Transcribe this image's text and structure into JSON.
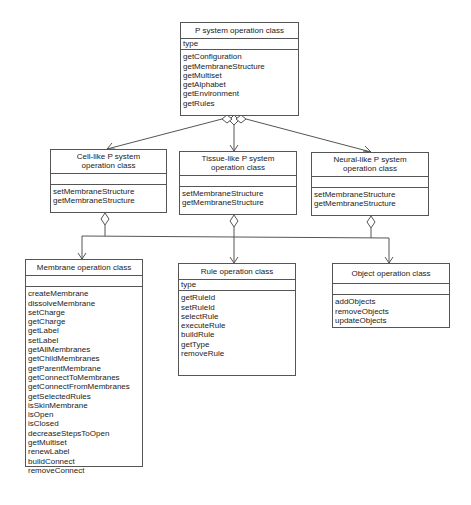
{
  "classes": {
    "psystem": {
      "title": "P system operation class",
      "attributes": [
        "type"
      ],
      "operations": [
        "getConfiguration",
        "getMembraneStructure",
        "getMultiset",
        "getAlphabet",
        "getEnvironment",
        "getRules"
      ]
    },
    "cell": {
      "title": "Cell-like P system operation class",
      "attributes": [],
      "operations": [
        "setMembraneStructure",
        "getMembraneStructure"
      ]
    },
    "tissue": {
      "title": "Tissue-like P system operation class",
      "attributes": [],
      "operations": [
        "setMembraneStructure",
        "getMembraneStructure"
      ]
    },
    "neural": {
      "title": "Neural-like P system operation class",
      "attributes": [],
      "operations": [
        "setMembraneStructure",
        "getMembraneStructure"
      ]
    },
    "membrane": {
      "title": "Membrane operation class",
      "attributes": [],
      "operations": [
        "createMembrane",
        "dissolveMembrane",
        "setCharge",
        "getCharge",
        "getLabel",
        "setLabel",
        "getAllMembranes",
        "getChildMembranes",
        "getParentMembrane",
        "getConnectToMembranes",
        "getConnectFromMembranes",
        "getSelectedRules",
        "isSkinMembrane",
        "isOpen",
        "isClosed",
        "decreaseStepsToOpen",
        "getMultiset",
        "renewLabel",
        "buildConnect",
        "removeConnect"
      ]
    },
    "rule": {
      "title": "Rule operation class",
      "attributes": [
        "type"
      ],
      "operations": [
        "getRuleId",
        "setRuleId",
        "selectRule",
        "executeRule",
        "buildRule",
        "getType",
        "removeRule"
      ]
    },
    "object": {
      "title": "Object operation class",
      "attributes": [],
      "operations": [
        "addObjects",
        "removeObjects",
        "updateObjects"
      ]
    }
  },
  "relations": [
    {
      "type": "aggregation",
      "from": "psystem",
      "to": "cell"
    },
    {
      "type": "aggregation",
      "from": "psystem",
      "to": "tissue"
    },
    {
      "type": "aggregation",
      "from": "psystem",
      "to": "neural"
    },
    {
      "type": "aggregation",
      "from": "cell",
      "to": "membrane"
    },
    {
      "type": "aggregation",
      "from": "tissue",
      "to": "rule"
    },
    {
      "type": "aggregation",
      "from": "neural",
      "to": "object"
    }
  ],
  "colors": {
    "line": "#555555",
    "background": "#ffffff",
    "text": "#222222"
  }
}
